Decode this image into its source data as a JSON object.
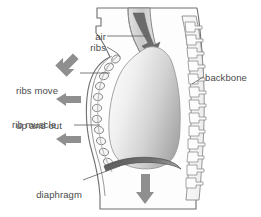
{
  "figure": {
    "type": "anatomical-diagram",
    "background_color": "#ffffff",
    "width": 261,
    "height": 217
  },
  "colors": {
    "outline": "#6e6e6e",
    "body_fill": "#fdfdfd",
    "lung_light": "#f2f2f2",
    "lung_dark": "#a9a9a9",
    "arrow_gray": "#8f8f8f",
    "arrow_dark": "#6b6b6b",
    "diaphragm": "#6a6a6a",
    "rib_fill": "#f5f5f5",
    "text": "#4a4a4a",
    "leader": "#5a5a5a"
  },
  "labels": [
    {
      "id": "air",
      "text": "air",
      "align": "right",
      "x": 72,
      "y": 36,
      "width": 34
    },
    {
      "id": "ribs",
      "text": "ribs",
      "align": "right",
      "x": 72,
      "y": 47,
      "width": 34
    },
    {
      "id": "ribs-move-up-and-out",
      "line1": "ribs move",
      "line2": "up and out",
      "align": "left",
      "x": 16,
      "y": 62,
      "width": 62
    },
    {
      "id": "rib-muscle",
      "text": "rib muscle",
      "align": "left",
      "x": 12,
      "y": 121,
      "width": 60
    },
    {
      "id": "diaphragm-flattens",
      "line1": "diaphragm",
      "line2": "flattens",
      "align": "right",
      "x": 18,
      "y": 168,
      "width": 62
    },
    {
      "id": "backbone",
      "text": "backbone",
      "align": "left",
      "x": 205,
      "y": 74,
      "width": 54
    }
  ],
  "arrows": [
    {
      "id": "air-inflow-arrow",
      "direction": "down-into-trachea",
      "color": "#6b6b6b"
    },
    {
      "id": "rib-movement-arrow-top",
      "direction": "up-left",
      "color": "#8f8f8f"
    },
    {
      "id": "rib-movement-arrow-middle",
      "direction": "left",
      "color": "#8f8f8f"
    },
    {
      "id": "rib-movement-arrow-bottom",
      "direction": "left",
      "color": "#8f8f8f"
    },
    {
      "id": "diaphragm-movement-arrow",
      "direction": "down",
      "color": "#8f8f8f"
    }
  ],
  "anatomy_parts": [
    {
      "id": "trachea",
      "name": "trachea"
    },
    {
      "id": "lung",
      "name": "lung"
    },
    {
      "id": "ribs-chain",
      "name": "ribs",
      "count": 11
    },
    {
      "id": "rib-muscle-band",
      "name": "rib muscle"
    },
    {
      "id": "diaphragm",
      "name": "diaphragm"
    },
    {
      "id": "backbone",
      "name": "backbone",
      "vertebrae_count": 13
    },
    {
      "id": "body-outline",
      "name": "body outline"
    }
  ]
}
